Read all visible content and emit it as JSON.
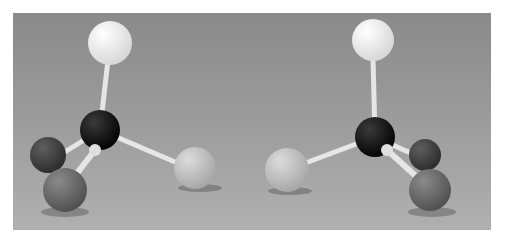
{
  "image": {
    "description": "Photograph of two mirror-image ball-and-stick tetrahedral molecular models on a gray background",
    "colors": {
      "background": "#9a9a9a",
      "carbon": "#151515",
      "white_atom": "#f2f2f2",
      "dark_atom": "#4a4a4a",
      "mid_atom": "#6e6e6e",
      "light_atom": "#c4c4c4",
      "bond": "#e6e6e6"
    }
  },
  "models": [
    {
      "name": "left-molecule",
      "center": [
        100,
        130
      ],
      "atoms": [
        {
          "role": "top",
          "x": 110,
          "y": 43,
          "r": 22,
          "color": "#f2f2f2"
        },
        {
          "role": "back-left",
          "x": 48,
          "y": 155,
          "r": 18,
          "color": "#4a4a4a"
        },
        {
          "role": "front-left",
          "x": 65,
          "y": 190,
          "r": 22,
          "color": "#707070"
        },
        {
          "role": "right",
          "x": 195,
          "y": 168,
          "r": 21,
          "color": "#c4c4c4"
        }
      ]
    },
    {
      "name": "right-molecule",
      "center": [
        375,
        137
      ],
      "atoms": [
        {
          "role": "top",
          "x": 373,
          "y": 40,
          "r": 21,
          "color": "#f2f2f2"
        },
        {
          "role": "back-right",
          "x": 425,
          "y": 155,
          "r": 16,
          "color": "#4a4a4a"
        },
        {
          "role": "front-right",
          "x": 430,
          "y": 190,
          "r": 21,
          "color": "#707070"
        },
        {
          "role": "left",
          "x": 287,
          "y": 170,
          "r": 22,
          "color": "#c4c4c4"
        }
      ]
    }
  ]
}
